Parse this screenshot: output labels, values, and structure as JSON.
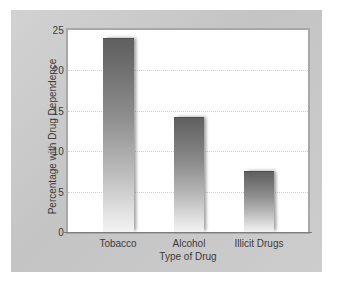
{
  "chart_data": {
    "type": "bar",
    "title": "",
    "subtitle": "",
    "categories": [
      "Tobacco",
      "Alcohol",
      "Illicit Drugs"
    ],
    "values": [
      24.0,
      14.2,
      7.5
    ],
    "xlabel": "Type of Drug",
    "ylabel": "Percentage with Drug Dependence",
    "ylim": [
      0,
      25
    ],
    "yticks": [
      0,
      5,
      10,
      15,
      20,
      25
    ],
    "ytick_labels": [
      "0",
      "5",
      "10",
      "15",
      "20",
      "25"
    ],
    "grid": "horizontal-dotted",
    "legend": "none",
    "series": [
      {
        "name": "Percentage with Drug Dependence",
        "values": [
          24.0,
          14.2,
          7.5
        ]
      }
    ],
    "annotations": [],
    "colors": {
      "bar_top": "#5f5f5f",
      "bar_bottom": "#f3f3f3",
      "plot_background": "#ffffff",
      "frame_background": "#c9c9c9",
      "gridline": "#cfcfcf",
      "axis": "#7d7d7d",
      "text": "#3b3b3b"
    }
  }
}
